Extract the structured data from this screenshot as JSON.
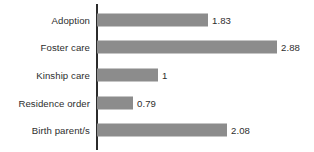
{
  "chart_data": {
    "type": "bar",
    "orientation": "horizontal",
    "title": "",
    "subtitle": "",
    "xlabel": "",
    "ylabel": "",
    "categories": [
      "Adoption",
      "Foster care",
      "Kinship care",
      "Residence order",
      "Birth parent/s"
    ],
    "values": [
      1.83,
      2.88,
      1,
      0.79,
      2.08
    ],
    "value_labels": [
      "1.83",
      "2.88",
      "1",
      "0.79",
      "2.08"
    ],
    "xlim": [
      0,
      2.88
    ],
    "grid": false,
    "legend": null,
    "legend_position": "none",
    "axis_ticks": [],
    "annotations": []
  },
  "style": {
    "bar_color": "#8c8c8c",
    "axis_color": "#2b2b2b",
    "text_color": "#2e2e2e",
    "background": "#ffffff"
  },
  "rows": [
    {
      "label": "Adoption",
      "value": "1.83",
      "bar_px": 111
    },
    {
      "label": "Foster care",
      "value": "2.88",
      "bar_px": 180
    },
    {
      "label": "Kinship care",
      "value": "1",
      "bar_px": 61
    },
    {
      "label": "Residence order",
      "value": "0.79",
      "bar_px": 36
    },
    {
      "label": "Birth parent/s",
      "value": "2.08",
      "bar_px": 130
    }
  ]
}
